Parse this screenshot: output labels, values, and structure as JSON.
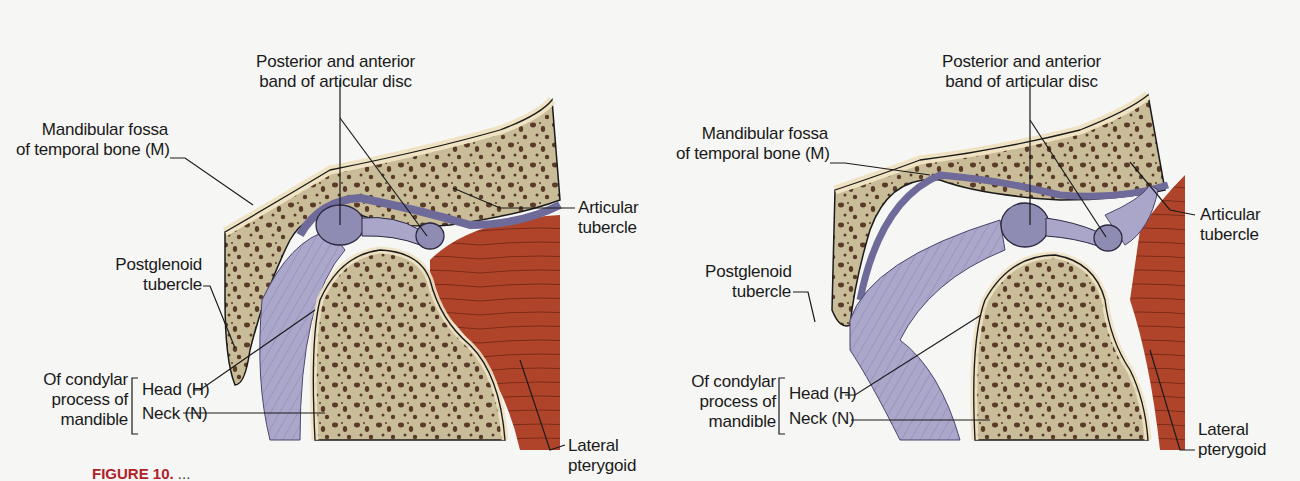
{
  "figure": {
    "panels": [
      {
        "id": "closed",
        "labels": {
          "disc": [
            "Posterior and anterior",
            "band of articular disc"
          ],
          "fossa": [
            "Mandibular fossa",
            "of temporal bone (M)"
          ],
          "articular_tubercle": [
            "Articular",
            "tubercle"
          ],
          "postglenoid": [
            "Postglenoid",
            "tubercle"
          ],
          "condylar_group": [
            "Of condylar",
            "process of",
            "mandible"
          ],
          "head": "Head (H)",
          "neck": "Neck (N)",
          "lateral_pterygoid": [
            "Lateral",
            "pterygoid"
          ]
        }
      },
      {
        "id": "open",
        "labels": {
          "disc": [
            "Posterior and anterior",
            "band of articular disc"
          ],
          "fossa": [
            "Mandibular fossa",
            "of temporal bone (M)"
          ],
          "articular_tubercle": [
            "Articular",
            "tubercle"
          ],
          "postglenoid": [
            "Postglenoid",
            "tubercle"
          ],
          "condylar_group": [
            "Of condylar",
            "process of",
            "mandible"
          ],
          "head": "Head (H)",
          "neck": "Neck (N)",
          "lateral_pterygoid": [
            "Lateral",
            "pterygoid"
          ]
        }
      }
    ],
    "caption": {
      "figure_number": "FIGURE 10.",
      "text": "   ...  "
    }
  },
  "colors": {
    "background": "#f6f6f4",
    "bone_cortex": "#efe3c4",
    "bone_spongy": "#c9bc98",
    "bone_pores": "#5a3a28",
    "disc": "#8f8cb3",
    "ligament": "#a9a6c9",
    "capsule_line": "#6e6a9a",
    "muscle": "#b0442a",
    "leader": "#1a1a1a",
    "caption_red": "#b0222a"
  }
}
